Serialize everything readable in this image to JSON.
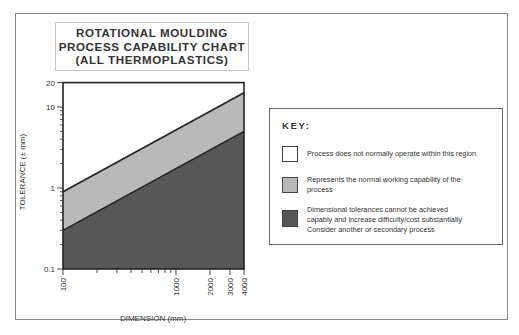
{
  "title": {
    "lines": [
      "ROTATIONAL MOULDING",
      "PROCESS CAPABILITY CHART",
      "(ALL THERMOPLASTICS)"
    ]
  },
  "colors": {
    "region_above": "#ffffff",
    "region_normal": "#b9b9b9",
    "region_below": "#575757",
    "line": "#222222",
    "frame": "#8a8a8a"
  },
  "key": {
    "title": "KEY:",
    "items": [
      {
        "swatch": "white",
        "color": "#ffffff",
        "lines": [
          "Process does not normally operate within this region"
        ]
      },
      {
        "swatch": "light-grey",
        "color": "#b9b9b9",
        "lines": [
          "Represents the normal working capability of the",
          "process"
        ]
      },
      {
        "swatch": "dark-grey",
        "color": "#575757",
        "lines": [
          "Dimensional tolerances cannot be achieved",
          "capably and increase difficulty/cost substantially",
          "Consider another or secondary process"
        ]
      }
    ]
  },
  "chart_data": {
    "type": "area",
    "title": "ROTATIONAL MOULDING PROCESS CAPABILITY CHART (ALL THERMOPLASTICS)",
    "xlabel": "DIMENSION (mm)",
    "ylabel": "TOLERANCE (± mm)",
    "xscale": "log",
    "yscale": "log",
    "xlim": [
      100,
      4000
    ],
    "ylim": [
      0.1,
      20
    ],
    "x_tick_labels": [
      "100",
      "1000",
      "2000",
      "3000",
      "4000"
    ],
    "y_tick_labels": [
      "0.1",
      "1",
      "10",
      "20"
    ],
    "grid": false,
    "legend_position": "right",
    "x": [
      100,
      4000
    ],
    "series": [
      {
        "name": "Upper limit (normal working capability)",
        "values": [
          0.9,
          15
        ]
      },
      {
        "name": "Lower limit (normal working capability)",
        "values": [
          0.3,
          5
        ]
      }
    ],
    "regions": [
      {
        "name": "Process does not normally operate within this region",
        "position": "above upper line",
        "color": "#ffffff"
      },
      {
        "name": "Represents the normal working capability of the process",
        "position": "between lines",
        "color": "#b9b9b9"
      },
      {
        "name": "Dimensional tolerances cannot be achieved capably and increase difficulty/cost substantially. Consider another or secondary process",
        "position": "below lower line",
        "color": "#575757"
      }
    ]
  }
}
